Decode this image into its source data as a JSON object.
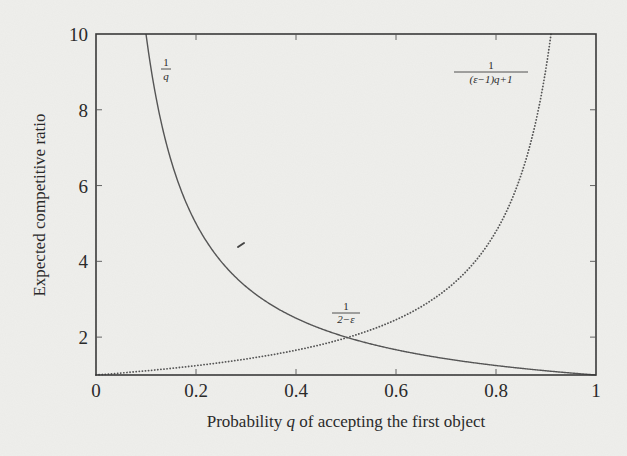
{
  "chart_data": {
    "type": "line",
    "title": "",
    "xlabel": "Probability q of accepting the first object",
    "xlabel_parts": {
      "before": "Probability ",
      "var": "q",
      "after": " of accepting the first object"
    },
    "ylabel": "Expected competitive ratio",
    "xlim": [
      0,
      1
    ],
    "ylim": [
      1,
      10
    ],
    "x_ticks": [
      0,
      0.2,
      0.4,
      0.6,
      0.8,
      1
    ],
    "x_tick_labels": [
      "0",
      "0.2",
      "0.4",
      "0.6",
      "0.8",
      "1"
    ],
    "y_ticks": [
      2,
      4,
      6,
      8,
      10
    ],
    "y_tick_labels": [
      "2",
      "4",
      "6",
      "8",
      "10"
    ],
    "grid": false,
    "legend": null,
    "epsilon": 0.011,
    "series": [
      {
        "name": "1/q",
        "formula": "1/q",
        "style": "solid",
        "color": "#555555",
        "x": [
          0.1,
          0.15,
          0.2,
          0.25,
          0.3,
          0.4,
          0.5,
          0.6,
          0.7,
          0.8,
          0.9,
          1.0
        ],
        "values": [
          10,
          6.67,
          5,
          4,
          3.33,
          2.5,
          2,
          1.67,
          1.43,
          1.25,
          1.11,
          1
        ]
      },
      {
        "name": "1/((ε−1)q+1)",
        "formula": "1/((eps-1)q+1)",
        "style": "dotted",
        "color": "#555555",
        "x": [
          0,
          0.1,
          0.2,
          0.3,
          0.4,
          0.5,
          0.6,
          0.7,
          0.8,
          0.85,
          0.9,
          0.91
        ],
        "values": [
          1,
          1.11,
          1.25,
          1.42,
          1.66,
          1.98,
          2.46,
          3.25,
          4.8,
          6.33,
          9.17,
          10
        ]
      }
    ],
    "annotations": [
      {
        "text": "1/q",
        "numerator": "1",
        "denominator": "q",
        "x": 0.138,
        "y": 9.0
      },
      {
        "text": "1/((ε−1)q+1)",
        "numerator": "1",
        "denominator": "(ε−1)q+1",
        "x": 0.78,
        "y": 9.0
      },
      {
        "text": "1/(2−ε)",
        "numerator": "1",
        "denominator": "2−ε",
        "x": 0.5,
        "y": 2.4,
        "marks": "intersection of curves at q = 1/(2−ε)"
      }
    ]
  }
}
